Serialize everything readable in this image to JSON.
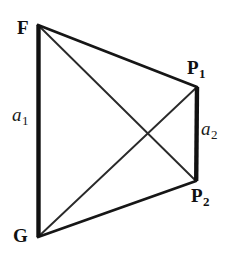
{
  "figure": {
    "background_color": "#ffffff",
    "stroke_color": "#1a1a1a",
    "width": 232,
    "height": 257
  },
  "vertices": {
    "F": {
      "label": "F",
      "subscript": "",
      "x": 38,
      "y": 25
    },
    "P1": {
      "label": "P",
      "subscript": "1",
      "x": 197,
      "y": 87
    },
    "P2": {
      "label": "P",
      "subscript": "2",
      "x": 196,
      "y": 181
    },
    "G": {
      "label": "G",
      "subscript": "",
      "x": 38,
      "y": 237
    }
  },
  "sides": {
    "a1": {
      "label": "a",
      "subscript": "1",
      "from": "F",
      "to": "G",
      "style": "thick"
    },
    "a2": {
      "label": "a",
      "subscript": "2",
      "from": "P1",
      "to": "P2",
      "style": "thick"
    }
  },
  "edges": [
    {
      "name": "edge-F-G",
      "from": "F",
      "to": "G",
      "width": 4.2,
      "kind": "side"
    },
    {
      "name": "edge-P1-P2",
      "from": "P1",
      "to": "P2",
      "width": 4.2,
      "kind": "side"
    },
    {
      "name": "edge-F-P1",
      "from": "F",
      "to": "P1",
      "width": 2.6,
      "kind": "side"
    },
    {
      "name": "edge-G-P2",
      "from": "G",
      "to": "P2",
      "width": 2.6,
      "kind": "side"
    },
    {
      "name": "edge-F-P2",
      "from": "F",
      "to": "P2",
      "width": 1.8,
      "kind": "diagonal"
    },
    {
      "name": "edge-G-P1",
      "from": "G",
      "to": "P1",
      "width": 1.8,
      "kind": "diagonal"
    }
  ],
  "intersection": {
    "x": 143,
    "y": 143
  }
}
